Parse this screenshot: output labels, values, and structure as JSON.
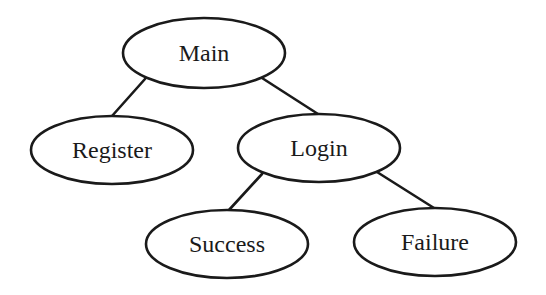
{
  "diagram": {
    "type": "tree",
    "colors": {
      "background": "#ffffff",
      "stroke": "#1a1a1a",
      "text": "#1a1a1a"
    },
    "nodes": [
      {
        "id": "main",
        "label": "Main",
        "cx": 204,
        "cy": 53,
        "rx": 81,
        "ry": 35
      },
      {
        "id": "register",
        "label": "Register",
        "cx": 112,
        "cy": 150,
        "rx": 81,
        "ry": 34
      },
      {
        "id": "login",
        "label": "Login",
        "cx": 319,
        "cy": 148,
        "rx": 81,
        "ry": 34
      },
      {
        "id": "success",
        "label": "Success",
        "cx": 227,
        "cy": 244,
        "rx": 81,
        "ry": 34
      },
      {
        "id": "failure",
        "label": "Failure",
        "cx": 435,
        "cy": 242,
        "rx": 81,
        "ry": 34
      }
    ],
    "edges": [
      {
        "from": "main",
        "to": "register",
        "x1": 145,
        "y1": 79,
        "x2": 112,
        "y2": 116
      },
      {
        "from": "main",
        "to": "login",
        "x1": 262,
        "y1": 78,
        "x2": 318,
        "y2": 114
      },
      {
        "from": "login",
        "to": "success",
        "x1": 262,
        "y1": 174,
        "x2": 229,
        "y2": 210
      },
      {
        "from": "login",
        "to": "failure",
        "x1": 377,
        "y1": 172,
        "x2": 434,
        "y2": 208
      }
    ]
  }
}
